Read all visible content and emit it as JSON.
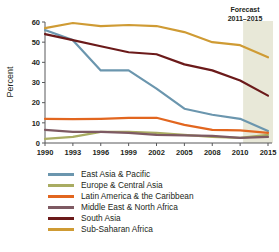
{
  "chart_data": {
    "type": "line",
    "title": "",
    "xlabel": "",
    "ylabel": "Percent",
    "ylim": [
      0,
      60
    ],
    "yticks": [
      0,
      10,
      20,
      30,
      40,
      50,
      60
    ],
    "grid": false,
    "legend_position": "below",
    "categories": [
      "1990",
      "1993",
      "1996",
      "1999",
      "2002",
      "2005",
      "2008",
      "2010",
      "2015"
    ],
    "x": [
      1990,
      1993,
      1996,
      1999,
      2002,
      2005,
      2008,
      2010,
      2015
    ],
    "annotations": [
      {
        "name": "forecast-band",
        "line1": "Forecast",
        "line2": "2011–2015",
        "start": 2011,
        "end": 2015,
        "color": "#e8e8d8"
      }
    ],
    "series": [
      {
        "name": "East Asia & Pacific",
        "color": "#6b96ae",
        "values": [
          56,
          51,
          36,
          36,
          27,
          17,
          14,
          12,
          6
        ]
      },
      {
        "name": "Europe & Central Asia",
        "color": "#a9ac62",
        "values": [
          2,
          3,
          5.5,
          5.5,
          5,
          4,
          3,
          2.5,
          4
        ]
      },
      {
        "name": "Latin America & the Caribbean",
        "color": "#e2661f",
        "values": [
          12,
          11.8,
          12,
          12.5,
          12.5,
          9,
          6.5,
          6.3,
          5
        ]
      },
      {
        "name": "Middle East & North Africa",
        "color": "#7e5a63",
        "values": [
          6.5,
          5.5,
          5.5,
          5,
          4,
          3.8,
          3.5,
          2.5,
          3
        ]
      },
      {
        "name": "South Asia",
        "color": "#6b1a1a",
        "values": [
          54,
          51,
          48,
          45,
          44,
          39,
          36,
          31,
          23.5
        ]
      },
      {
        "name": "Sub-Saharan Africa",
        "color": "#cf9b34",
        "values": [
          57,
          59.5,
          58,
          58.5,
          58,
          55,
          50,
          48.5,
          42.5
        ]
      }
    ]
  },
  "axis": {
    "y_title": "Percent",
    "y_ticks": [
      "60",
      "50",
      "40",
      "30",
      "20",
      "10",
      "0"
    ],
    "x_ticks": [
      "1990",
      "1993",
      "1996",
      "1999",
      "2002",
      "2005",
      "2008",
      "2010",
      "2015"
    ]
  },
  "forecast": {
    "line1": "Forecast",
    "line2": "2011–2015"
  },
  "legend": {
    "items": [
      {
        "label": "East Asia & Pacific",
        "color": "#6b96ae"
      },
      {
        "label": "Europe & Central Asia",
        "color": "#a9ac62"
      },
      {
        "label": "Latin America & the Caribbean",
        "color": "#e2661f"
      },
      {
        "label": "Middle East & North Africa",
        "color": "#7e5a63"
      },
      {
        "label": "South Asia",
        "color": "#6b1a1a"
      },
      {
        "label": "Sub-Saharan Africa",
        "color": "#cf9b34"
      }
    ]
  }
}
